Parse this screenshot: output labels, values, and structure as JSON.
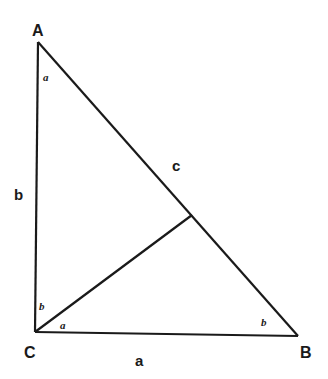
{
  "diagram": {
    "type": "right-triangle-with-altitude",
    "stroke_color": "#1a1a1a",
    "vertices": {
      "A": {
        "label": "A",
        "x": 38,
        "y": 42
      },
      "B": {
        "label": "B",
        "x": 298,
        "y": 336
      },
      "C": {
        "label": "C",
        "x": 35,
        "y": 332
      }
    },
    "altitude_foot": {
      "x": 192,
      "y": 215
    },
    "sides": {
      "a": "a",
      "b": "b",
      "c": "c"
    },
    "angles": {
      "at_A": "a",
      "at_C_upper": "b",
      "at_C_lower": "a",
      "at_B": "b"
    }
  }
}
